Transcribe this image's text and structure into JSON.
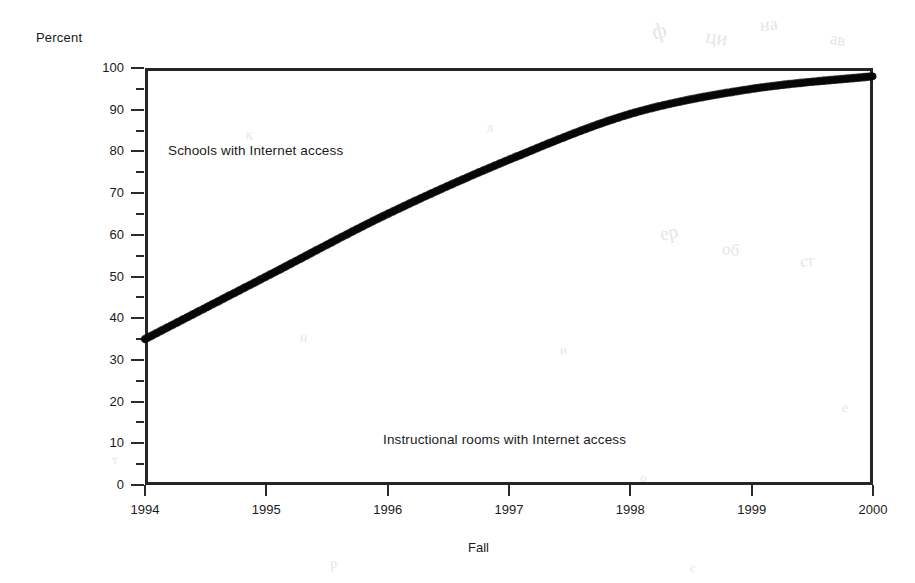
{
  "chart_data": {
    "type": "line",
    "title": "",
    "subtitle": "",
    "xlabel": "Fall",
    "ylabel": "Percent",
    "x": [
      1994,
      1995,
      1996,
      1997,
      1998,
      1999,
      2000
    ],
    "xtick_labels": [
      "1994",
      "1995",
      "1996",
      "1997",
      "1998",
      "1999",
      "2000"
    ],
    "ytick_labels": [
      "0",
      "10",
      "20",
      "30",
      "40",
      "50",
      "60",
      "70",
      "80",
      "90",
      "100"
    ],
    "ytick_values": [
      0,
      10,
      20,
      30,
      40,
      50,
      60,
      70,
      80,
      90,
      100
    ],
    "yminor_values": [
      5,
      15,
      25,
      35,
      45,
      55,
      65,
      75,
      85,
      95
    ],
    "ylim": [
      0,
      100
    ],
    "xlim": [
      1994,
      2000
    ],
    "grid": false,
    "legend_position": "inline-annotation",
    "line_color": "#1c1c1c",
    "line_width_px": 7,
    "series": [
      {
        "name": "Schools with Internet access",
        "values": [
          35,
          50,
          65,
          78,
          89,
          95,
          98
        ],
        "visible": true
      },
      {
        "name": "Instructional rooms with Internet access",
        "values": [
          3,
          8,
          14,
          27,
          51,
          64,
          77
        ],
        "visible": false
      }
    ],
    "annotations": [
      {
        "text": "Schools with Internet access",
        "x": 1994.2,
        "y": 82
      },
      {
        "text": "Instructional rooms with Internet access",
        "x": 1996.3,
        "y": 14
      }
    ]
  },
  "axes": {
    "y_title": "Percent",
    "x_title": "Fall"
  },
  "noise_marks": [
    {
      "text": "ф",
      "x": 652,
      "y": 18,
      "size": 22,
      "rot": -14
    },
    {
      "text": "ци",
      "x": 706,
      "y": 26,
      "size": 20,
      "rot": 9
    },
    {
      "text": "на",
      "x": 760,
      "y": 14,
      "size": 18,
      "rot": -6
    },
    {
      "text": "ав",
      "x": 830,
      "y": 30,
      "size": 17,
      "rot": 11
    },
    {
      "text": "ер",
      "x": 660,
      "y": 222,
      "size": 19,
      "rot": -10
    },
    {
      "text": "об",
      "x": 722,
      "y": 240,
      "size": 17,
      "rot": 7
    },
    {
      "text": "ст",
      "x": 800,
      "y": 252,
      "size": 16,
      "rot": -8
    },
    {
      "text": "к",
      "x": 246,
      "y": 126,
      "size": 15,
      "rot": 5
    },
    {
      "text": "л",
      "x": 486,
      "y": 120,
      "size": 14,
      "rot": -9
    },
    {
      "text": "н",
      "x": 300,
      "y": 330,
      "size": 14,
      "rot": 6
    },
    {
      "text": "и",
      "x": 560,
      "y": 342,
      "size": 13,
      "rot": -5
    },
    {
      "text": "е",
      "x": 842,
      "y": 400,
      "size": 14,
      "rot": 8
    },
    {
      "text": "т",
      "x": 112,
      "y": 452,
      "size": 13,
      "rot": -7
    },
    {
      "text": "о",
      "x": 640,
      "y": 470,
      "size": 13,
      "rot": 4
    },
    {
      "text": "р",
      "x": 330,
      "y": 556,
      "size": 14,
      "rot": -6
    },
    {
      "text": "с",
      "x": 690,
      "y": 560,
      "size": 13,
      "rot": 9
    }
  ]
}
